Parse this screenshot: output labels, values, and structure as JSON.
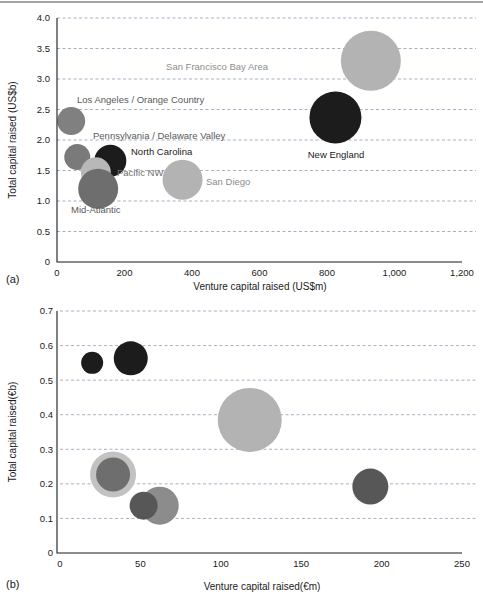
{
  "figure": {
    "panels": [
      "(a)",
      "(b)"
    ]
  },
  "chart_data": [
    {
      "type": "scatter",
      "panel": "(a)",
      "title": "",
      "xlabel": "Venture capital raised (US$m)",
      "ylabel": "Total capital raised (US$b)",
      "xlim": [
        0,
        1200
      ],
      "ylim": [
        0,
        4.0
      ],
      "xticks": [
        "0",
        "200",
        "400",
        "600",
        "800",
        "1,000",
        "1,200"
      ],
      "xtickvalues": [
        0,
        200,
        400,
        600,
        800,
        1000,
        1200
      ],
      "yticks": [
        "0",
        "0.5",
        "1.0",
        "1.5",
        "2.0",
        "2.5",
        "3.0",
        "3.5",
        "4.0"
      ],
      "ytickvalues": [
        0,
        0.5,
        1.0,
        1.5,
        2.0,
        2.5,
        3.0,
        3.5,
        4.0
      ],
      "grid": true,
      "legend": "none",
      "bubbles": [
        {
          "label": "San Francisco Bay Area",
          "x": 930,
          "y": 3.3,
          "size": 30,
          "color": "#b3b3b3",
          "label_color": "#8c8c8c",
          "label_x": 268,
          "label_y": 70,
          "label_anchor": "end"
        },
        {
          "label": "New England",
          "x": 825,
          "y": 2.37,
          "size": 26,
          "color": "#1c1c1c",
          "label_color": "#1a1a1a",
          "label_x": 336,
          "label_y": 158,
          "label_anchor": "middle"
        },
        {
          "label": "Los Angeles / Orange Country",
          "x": 42,
          "y": 2.31,
          "size": 14,
          "color": "#808080",
          "label_color": "#595959",
          "label_x": 77,
          "label_y": 103,
          "label_anchor": "start"
        },
        {
          "label": "Pennsylvania / Delaware Valley",
          "x": 60,
          "y": 1.72,
          "size": 13,
          "color": "#7a7a7a",
          "label_color": "#595959",
          "label_x": 93,
          "label_y": 139,
          "label_anchor": "start"
        },
        {
          "label": "North Carolina",
          "x": 158,
          "y": 1.66,
          "size": 16,
          "color": "#1c1c1c",
          "label_color": "#1a1a1a",
          "label_x": 131,
          "label_y": 155,
          "label_anchor": "start"
        },
        {
          "label": "Pacific NW",
          "x": 115,
          "y": 1.47,
          "size": 15,
          "color": "#b8b8b8",
          "label_color": "#6e6e6e",
          "label_x": 117,
          "label_y": 176,
          "label_anchor": "start"
        },
        {
          "label": "Mid-Atlantic",
          "x": 122,
          "y": 1.2,
          "size": 20,
          "color": "#6e6e6e",
          "label_color": "#595959",
          "label_x": 71,
          "label_y": 213,
          "label_anchor": "start"
        },
        {
          "label": "San Diego",
          "x": 372,
          "y": 1.35,
          "size": 20,
          "color": "#b3b3b3",
          "label_color": "#8c8c8c",
          "label_x": 206,
          "label_y": 185,
          "label_anchor": "start"
        }
      ]
    },
    {
      "type": "scatter",
      "panel": "(b)",
      "title": "",
      "xlabel": "Venture capital raised(€m)",
      "ylabel": "Total capital raised(€b)",
      "xlim": [
        0,
        250
      ],
      "ylim": [
        0,
        0.7
      ],
      "xticks": [
        "0",
        "50",
        "100",
        "150",
        "200",
        "250"
      ],
      "xtickvalues": [
        0,
        50,
        100,
        150,
        200,
        250
      ],
      "yticks": [
        "0",
        "0.1",
        "0.2",
        "0.3",
        "0.4",
        "0.5",
        "0.6",
        "0.7"
      ],
      "ytickvalues": [
        0,
        0.1,
        0.2,
        0.3,
        0.4,
        0.5,
        0.6,
        0.7
      ],
      "grid": true,
      "legend": "none",
      "bubbles": [
        {
          "label": "Ireland",
          "x": 20,
          "y": 0.55,
          "size": 11,
          "color": "#1c1c1c",
          "label_color": "#1a1a1a",
          "label_x": 66,
          "label_y": 341,
          "label_anchor": "start"
        },
        {
          "label": "Netherlands",
          "x": 44,
          "y": 0.563,
          "size": 17,
          "color": "#1c1c1c",
          "label_color": "#1a1a1a",
          "label_x": 164,
          "label_y": 361,
          "label_anchor": "start"
        },
        {
          "label": "United Kingdom",
          "x": 118,
          "y": 0.385,
          "size": 32,
          "color": "#b3b3b3",
          "label_color": "#9a9a9a",
          "label_x": 283,
          "label_y": 400,
          "label_anchor": "start"
        },
        {
          "label": "France",
          "x": 33,
          "y": 0.227,
          "size": 23,
          "color": "#c2c2c2",
          "label_color": "#b0b0b0",
          "label_x": 150,
          "label_y": 459,
          "label_anchor": "start"
        },
        {
          "label": "Belgium",
          "x": 33,
          "y": 0.227,
          "size": 17,
          "color": "#6e6e6e",
          "label_color": "#4a4a4a",
          "label_x": 157,
          "label_y": 476,
          "label_anchor": "start"
        },
        {
          "label": "Germany",
          "x": 62,
          "y": 0.137,
          "size": 19,
          "color": "#8c8c8c",
          "label_color": "#6e6e6e",
          "label_x": 190,
          "label_y": 503,
          "label_anchor": "start"
        },
        {
          "label": "Denmark",
          "x": 52,
          "y": 0.137,
          "size": 14,
          "color": "#575757",
          "label_color": "#6e6e6e",
          "label_x": 89,
          "label_y": 526,
          "label_anchor": "start"
        },
        {
          "label": "Switzerland",
          "x": 193,
          "y": 0.192,
          "size": 18,
          "color": "#575757",
          "label_color": "#4a4a4a",
          "label_x": 381,
          "label_y": 505,
          "label_anchor": "start"
        }
      ]
    }
  ]
}
